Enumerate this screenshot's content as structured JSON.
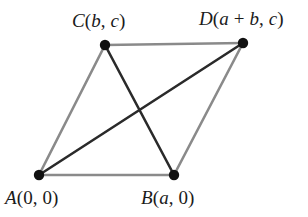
{
  "figure": {
    "background_color": "#ffffff",
    "width": 308,
    "height": 217
  },
  "style": {
    "side_color": "#8a8a8a",
    "diagonal_color": "#2a2a2a",
    "vertex_color": "#111111",
    "side_width": 2.6,
    "diagonal_width": 2.6,
    "vertex_radius": 5.2
  },
  "vertices": [
    {
      "id": "A",
      "name": "A",
      "coordinate_text": "(0, 0)",
      "label_full": "A(0, 0)",
      "label_parts": {
        "point": "A",
        "open": "(",
        "x": "0",
        "sep": ", ",
        "y": "0",
        "close": ")"
      },
      "x": 39,
      "y": 175
    },
    {
      "id": "B",
      "name": "B",
      "coordinate_text": "(a, 0)",
      "label_full": "B(a, 0)",
      "label_parts": {
        "point": "B",
        "open": "(",
        "x": "a",
        "sep": ", ",
        "y": "0",
        "close": ")"
      },
      "x": 174,
      "y": 175
    },
    {
      "id": "C",
      "name": "C",
      "coordinate_text": "(b, c)",
      "label_full": "C(b, c)",
      "label_parts": {
        "point": "C",
        "open": "(",
        "x": "b",
        "sep": ", ",
        "y": "c",
        "close": ")"
      },
      "x": 105,
      "y": 45
    },
    {
      "id": "D",
      "name": "D",
      "coordinate_text": "(a + b, c)",
      "label_full": "D(a + b, c)",
      "label_parts": {
        "point": "D",
        "open": "(",
        "x": "a",
        "plus": " + ",
        "x2": "b",
        "sep": ", ",
        "y": "c",
        "close": ")"
      },
      "x": 243,
      "y": 43
    }
  ],
  "edges": [
    {
      "id": "AB",
      "from": "A",
      "to": "B",
      "kind": "side",
      "color": "#8a8a8a"
    },
    {
      "id": "BD",
      "from": "B",
      "to": "D",
      "kind": "side",
      "color": "#8a8a8a"
    },
    {
      "id": "DC",
      "from": "D",
      "to": "C",
      "kind": "side",
      "color": "#8a8a8a"
    },
    {
      "id": "CA",
      "from": "C",
      "to": "A",
      "kind": "side",
      "color": "#8a8a8a"
    },
    {
      "id": "AD",
      "from": "A",
      "to": "D",
      "kind": "diagonal",
      "color": "#2a2a2a"
    },
    {
      "id": "CB",
      "from": "C",
      "to": "B",
      "kind": "diagonal",
      "color": "#2a2a2a"
    }
  ]
}
